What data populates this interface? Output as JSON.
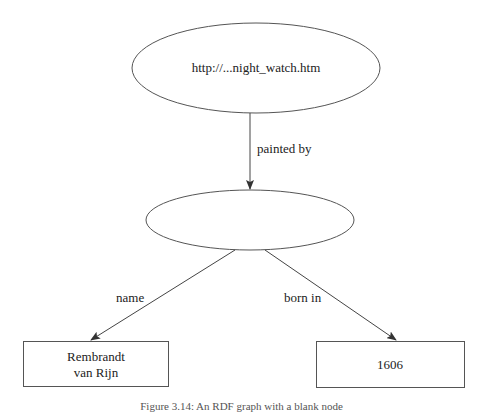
{
  "diagram": {
    "type": "rdf-graph",
    "colors": {
      "stroke": "#444444",
      "text": "#222222",
      "background": "#ffffff"
    },
    "nodes": [
      {
        "id": "resource",
        "shape": "ellipse",
        "label": "http://...night_watch.htm",
        "cx": 256,
        "cy": 68,
        "rx": 124,
        "ry": 45
      },
      {
        "id": "blank",
        "shape": "ellipse",
        "label": "",
        "cx": 250,
        "cy": 220,
        "rx": 104,
        "ry": 30
      },
      {
        "id": "name-literal",
        "shape": "rect",
        "label_lines": [
          "Rembrandt",
          "van Rijn"
        ],
        "x": 23,
        "y": 341,
        "w": 145,
        "h": 45
      },
      {
        "id": "year-literal",
        "shape": "rect",
        "label": "1606",
        "x": 316,
        "y": 341,
        "w": 148,
        "h": 46
      }
    ],
    "edges": [
      {
        "from": "resource",
        "to": "blank",
        "label": "painted by"
      },
      {
        "from": "blank",
        "to": "name-literal",
        "label": "name"
      },
      {
        "from": "blank",
        "to": "year-literal",
        "label": "born in"
      }
    ]
  },
  "caption": "Figure 3.14: An RDF graph with a blank node"
}
